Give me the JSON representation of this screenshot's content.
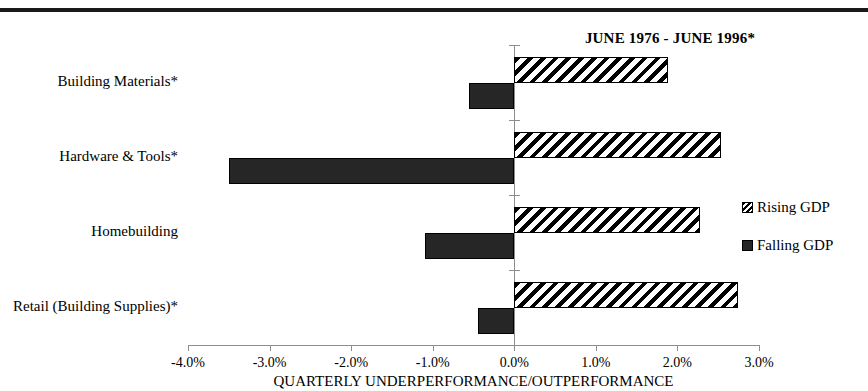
{
  "chart_data": {
    "type": "bar",
    "orientation": "horizontal",
    "title": "JUNE 1976 - JUNE 1996*",
    "xlabel": "QUARTERLY UNDERPERFORMANCE/OUTPERFORMANCE",
    "ylabel": "",
    "xlim": [
      -4.0,
      3.0
    ],
    "xticks": [
      -4.0,
      -3.0,
      -2.0,
      -1.0,
      0.0,
      1.0,
      2.0,
      3.0
    ],
    "xtick_labels": [
      "-4.0%",
      "-3.0%",
      "-2.0%",
      "-1.0%",
      "0.0%",
      "1.0%",
      "2.0%",
      "3.0%"
    ],
    "grid": false,
    "legend_position": "right",
    "categories": [
      "Building Materials*",
      "Hardware & Tools*",
      "Homebuilding",
      "Retail (Building Supplies)*"
    ],
    "series": [
      {
        "name": "Rising GDP",
        "fill": "hatched",
        "values": [
          1.89,
          2.53,
          2.28,
          2.74
        ]
      },
      {
        "name": "Falling GDP",
        "fill": "solid-black",
        "values": [
          -0.56,
          -3.5,
          -1.09,
          -0.45
        ]
      }
    ]
  },
  "legend": {
    "items": [
      {
        "label": "Rising GDP",
        "fill": "hatched"
      },
      {
        "label": "Falling GDP",
        "fill": "solid-black"
      }
    ]
  },
  "colors": {
    "series_falling": "#262626",
    "series_rising_stripe": "#000000",
    "axis": "#8d8d8d",
    "rule": "#1a1a1a",
    "background": "#ffffff"
  }
}
